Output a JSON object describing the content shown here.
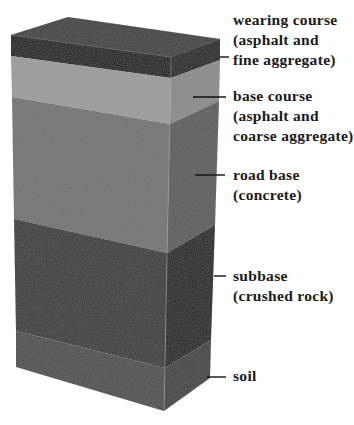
{
  "diagram": {
    "layers": [
      {
        "id": "wearing-course",
        "name": "wearing course",
        "lines": [
          "wearing course",
          "(asphalt and",
          "fine aggregate)"
        ],
        "colors": {
          "top": "#3a3a3a",
          "front": "#0a0a0a",
          "side": "#141414"
        }
      },
      {
        "id": "base-course",
        "name": "base course",
        "lines": [
          "base course",
          "(asphalt and",
          "coarse aggregate)"
        ],
        "colors": {
          "front": "#9b9b9b",
          "side": "#8a8a8a"
        }
      },
      {
        "id": "road-base",
        "name": "road base",
        "lines": [
          "road base",
          "(concrete)"
        ],
        "colors": {
          "front": "#727272",
          "side": "#5a5a5a"
        }
      },
      {
        "id": "subbase",
        "name": "subbase",
        "lines": [
          "subbase",
          "(crushed rock)"
        ],
        "colors": {
          "front": "#343434",
          "side": "#141414"
        }
      },
      {
        "id": "soil",
        "name": "soil",
        "lines": [
          "soil"
        ],
        "colors": {
          "front": "#4b4b4b",
          "side": "#3c3c3c"
        }
      }
    ]
  }
}
